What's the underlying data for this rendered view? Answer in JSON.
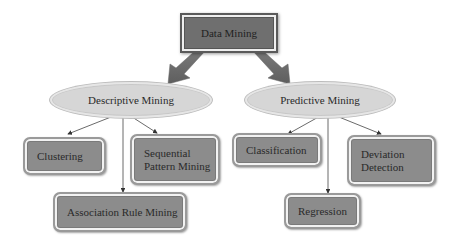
{
  "diagram": {
    "root": {
      "label": "Data Mining"
    },
    "branches": [
      {
        "label": "Descriptive Mining",
        "children": [
          {
            "label": "Clustering"
          },
          {
            "label": "Sequential\nPattern Mining"
          },
          {
            "label": "Association Rule Mining"
          }
        ]
      },
      {
        "label": "Predictive Mining",
        "children": [
          {
            "label": "Classification"
          },
          {
            "label": "Deviation\nDetection"
          },
          {
            "label": "Regression"
          }
        ]
      }
    ],
    "colors": {
      "root_fill": "#6f6f6f",
      "ellipse_fill": "#d6d6d6",
      "leaf_fill": "#8c8c8c",
      "arrow": "#555555",
      "line": "#444444"
    }
  }
}
